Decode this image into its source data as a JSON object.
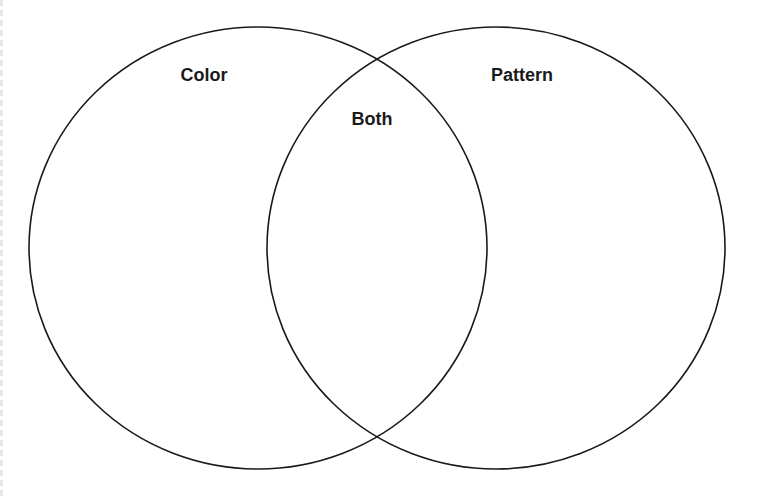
{
  "diagram": {
    "type": "venn",
    "sets": [
      {
        "id": "left",
        "label": "Color",
        "cx": 258,
        "cy": 248,
        "rx": 229,
        "ry": 221
      },
      {
        "id": "right",
        "label": "Pattern",
        "cx": 496,
        "cy": 248,
        "rx": 229,
        "ry": 221
      }
    ],
    "intersection": {
      "label": "Both"
    },
    "stroke_color": "#1a1a1a",
    "background": "#ffffff"
  }
}
